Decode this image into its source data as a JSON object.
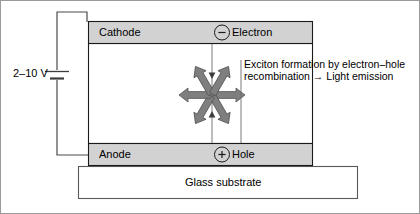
{
  "diagram": {
    "type": "schematic",
    "canvas": {
      "width": 420,
      "height": 214,
      "background": "#ffffff"
    },
    "colors": {
      "electrode_fill": "#d2d2d2",
      "electrode_stroke": "#000000",
      "substrate_fill": "#ffffff",
      "substrate_stroke": "#555555",
      "emissive_fill": "#ffffff",
      "arrow_fill": "#808080",
      "arrow_stroke": "#4d4d4d",
      "wire_stroke": "#4a4a4a",
      "text": "#000000",
      "frame": "#9a9a9a"
    }
  },
  "circuit": {
    "voltage_label": "2–10 V",
    "battery_symbol": "battery-cell",
    "terminal_top": "cathode",
    "terminal_bottom": "anode"
  },
  "layers": {
    "cathode": {
      "label": "Cathode",
      "fill": "#d2d2d2",
      "x": 88,
      "y": 21,
      "width": 225,
      "height": 23
    },
    "emissive": {
      "label": "",
      "fill": "#ffffff",
      "x": 88,
      "y": 44,
      "width": 225,
      "height": 99
    },
    "anode": {
      "label": "Anode",
      "fill": "#d2d2d2",
      "x": 88,
      "y": 143,
      "width": 225,
      "height": 23
    },
    "substrate": {
      "label": "Glass substrate",
      "fill": "#ffffff",
      "x": 78,
      "y": 166,
      "width": 280,
      "height": 33
    }
  },
  "carriers": [
    {
      "name": "electron",
      "symbol": "−",
      "label": "Electron",
      "badge": "minus-circle"
    },
    {
      "name": "hole",
      "symbol": "+",
      "label": "Hole",
      "badge": "plus-circle"
    }
  ],
  "annotation": {
    "line1": "Exciton formation by electron–hole",
    "line2": "recombination → Light emission"
  },
  "emission": {
    "description": "six radiating light-emission arrows from recombination centre",
    "center_x": 212,
    "center_y": 95,
    "ray_count": 6,
    "ray_angles_deg": [
      0,
      60,
      120,
      180,
      240,
      300
    ]
  }
}
